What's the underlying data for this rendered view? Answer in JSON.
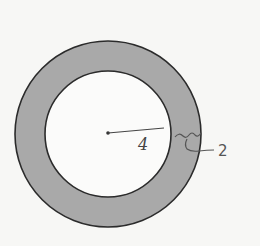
{
  "diagram": {
    "labels": {
      "inner_radius": "4",
      "ring_width": "2"
    },
    "colors": {
      "ring_fill": "#a9a9a9",
      "stroke": "#2b2b2b",
      "background": "#f7f7f5",
      "inner_fill": "#fbfbfa"
    }
  }
}
